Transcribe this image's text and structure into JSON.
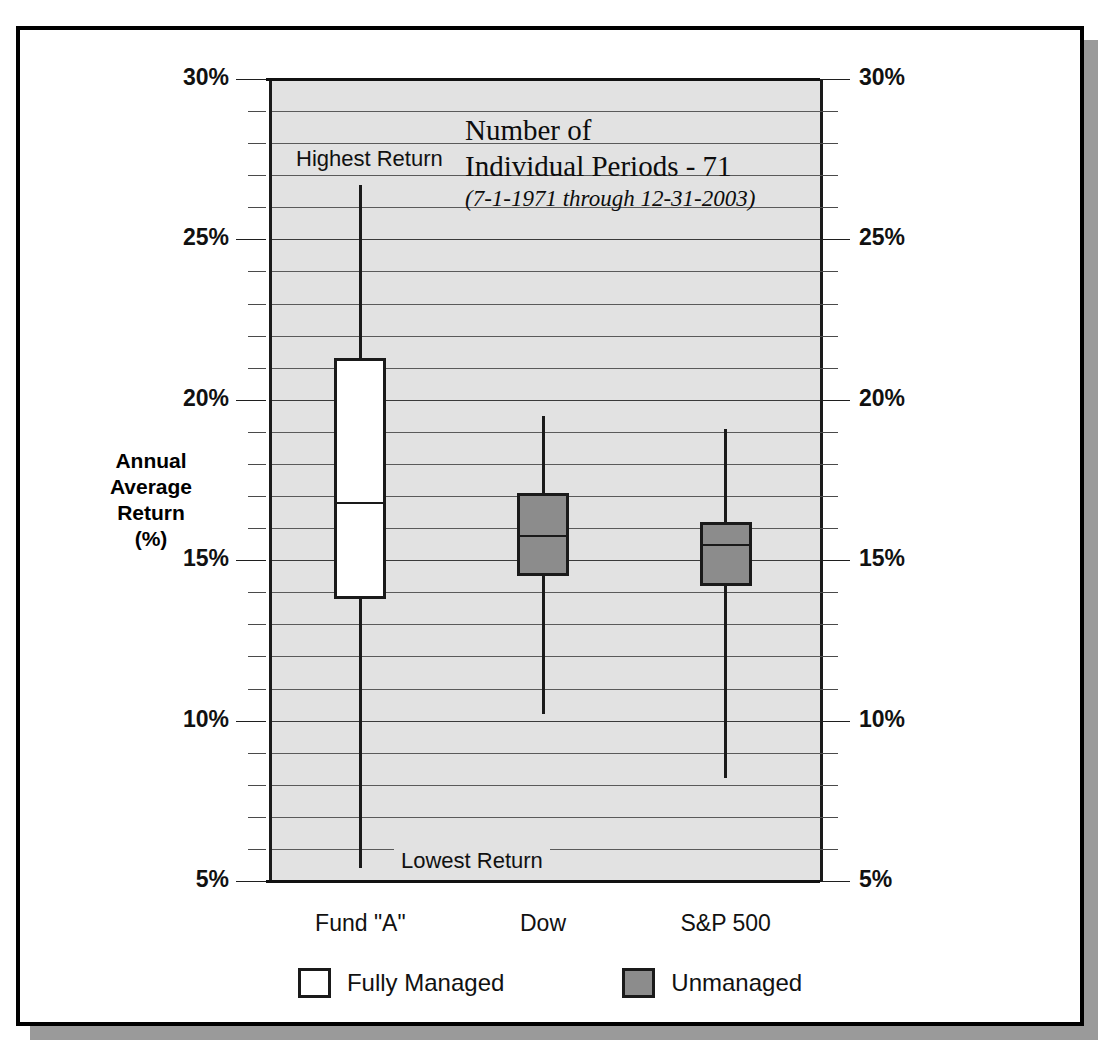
{
  "chart_data": {
    "type": "box",
    "title": "",
    "xlabel": "",
    "ylabel": "Annual\nAverage\nReturn\n(%)",
    "ylabel_lines": [
      "Annual",
      "Average",
      "Return",
      "(%)"
    ],
    "ylim": [
      5,
      30
    ],
    "ytick_step": 5,
    "minor_tick_step": 1,
    "grid": true,
    "grid_axis": "y",
    "categories": [
      "Fund \"A\"",
      "Dow",
      "S&P 500"
    ],
    "ytick_labels": [
      "30%",
      "25%",
      "20%",
      "15%",
      "10%",
      "5%"
    ],
    "ytick_values": [
      30,
      25,
      20,
      15,
      10,
      5
    ],
    "axis_label_side": "both",
    "series": [
      {
        "name": "Fund \"A\"",
        "group": "Fully Managed",
        "fill": "#ffffff",
        "whisker_high": 26.7,
        "box_top": 21.3,
        "median": 16.8,
        "box_bottom": 13.8,
        "whisker_low": 5.4
      },
      {
        "name": "Dow",
        "group": "Unmanaged",
        "fill": "#8c8c8c",
        "whisker_high": 19.5,
        "box_top": 17.1,
        "median": 15.8,
        "box_bottom": 14.5,
        "whisker_low": 10.2
      },
      {
        "name": "S&P 500",
        "group": "Unmanaged",
        "fill": "#8c8c8c",
        "whisker_high": 19.1,
        "box_top": 16.2,
        "median": 15.5,
        "box_bottom": 14.2,
        "whisker_low": 8.2
      }
    ],
    "annotations": {
      "highest_return": "Highest Return",
      "lowest_return": "Lowest Return",
      "note_line1": "Number of",
      "note_line2": "Individual Periods - 71",
      "note_line3": "(7-1-1971 through 12-31-2003)"
    },
    "legend": {
      "position": "bottom",
      "entries": [
        {
          "label": "Fully Managed",
          "color": "#ffffff"
        },
        {
          "label": "Unmanaged",
          "color": "#8c8c8c"
        }
      ]
    },
    "colors": {
      "plot_background": "#e2e2e2",
      "frame": "#000000",
      "shadow": "#9a9a9a",
      "line": "#1a1a1a",
      "unmanaged_fill": "#8c8c8c",
      "managed_fill": "#ffffff"
    }
  }
}
